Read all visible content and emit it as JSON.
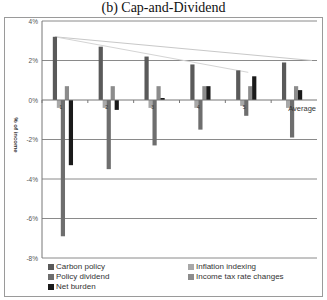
{
  "chart_data": {
    "type": "bar",
    "title": "(b) Cap-and-Dividend",
    "xlabel": "",
    "ylabel": "% of income",
    "ylim": [
      -8,
      4
    ],
    "yticks": [
      "4%",
      "2%",
      "0%",
      "-2%",
      "-4%",
      "-6%",
      "-8%"
    ],
    "categories": [
      "1",
      "2",
      "3",
      "4",
      "5",
      "Average"
    ],
    "series": [
      {
        "name": "Carbon policy",
        "color": "#5a5a5a",
        "values": [
          3.2,
          2.7,
          2.2,
          1.8,
          1.5,
          1.9
        ]
      },
      {
        "name": "Inflation indexing",
        "color": "#a8a8a8",
        "values": [
          -0.4,
          -0.4,
          -0.4,
          -0.4,
          -0.3,
          -0.4
        ]
      },
      {
        "name": "Policy dividend",
        "color": "#6e6e6e",
        "values": [
          -6.9,
          -3.5,
          -2.3,
          -1.5,
          -0.8,
          -1.9
        ]
      },
      {
        "name": "Income tax rate changes",
        "color": "#8c8c8c",
        "values": [
          0.7,
          0.7,
          0.7,
          0.7,
          0.7,
          0.7
        ]
      },
      {
        "name": "Net burden",
        "color": "#1a1a1a",
        "values": [
          -3.3,
          -0.5,
          0.1,
          0.7,
          1.2,
          0.5
        ]
      }
    ],
    "grid": true,
    "legend_position": "bottom",
    "annotations": [
      "two faint trend lines descending from the top of the first Carbon policy bar toward the right"
    ]
  },
  "legend": {
    "items": [
      {
        "label": "Carbon policy",
        "color": "#5a5a5a"
      },
      {
        "label": "Inflation indexing",
        "color": "#a8a8a8"
      },
      {
        "label": "Policy dividend",
        "color": "#6e6e6e"
      },
      {
        "label": "Income tax rate changes",
        "color": "#8c8c8c"
      },
      {
        "label": "Net burden",
        "color": "#1a1a1a"
      }
    ]
  }
}
